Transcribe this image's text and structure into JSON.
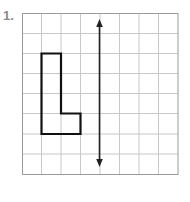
{
  "problem": {
    "number_label": "1."
  },
  "grid": {
    "columns": 8,
    "rows": 8,
    "line_color": "#c8c8c8",
    "border_color": "#9a9a9a"
  },
  "shape": {
    "name": "L-shape",
    "stroke_color": "#111111"
  },
  "line_of_reflection": {
    "orientation": "vertical",
    "color": "#222222"
  }
}
